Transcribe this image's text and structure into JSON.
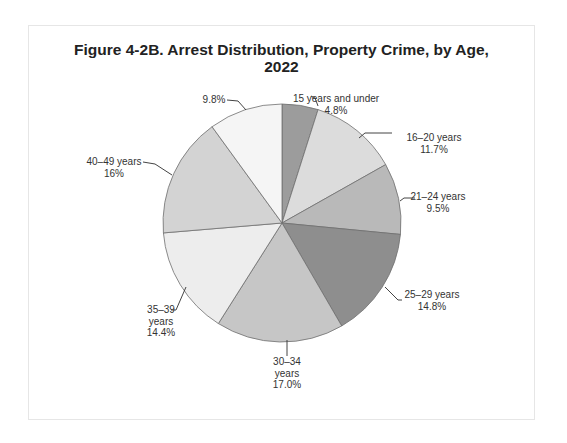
{
  "chart_data": {
    "type": "pie",
    "title": "Figure 4-2B. Arrest Distribution, Property Crime, by Age, 2022",
    "title_lines": [
      "Figure 4-2B. Arrest Distribution, Property Crime, by Age,",
      "2022"
    ],
    "start": "12 o'clock",
    "direction": "clockwise",
    "slices": [
      {
        "name": "15 years and under",
        "value": 4.8,
        "value_label": "4.8%",
        "label_lines": [
          "15 years and under",
          "4.8%"
        ],
        "color": "#9c9c9c"
      },
      {
        "name": "16–20 years",
        "value": 11.7,
        "value_label": "11.7%",
        "label_lines": [
          "16–20 years",
          "11.7%"
        ],
        "color": "#dcdcdc"
      },
      {
        "name": "21–24 years",
        "value": 9.5,
        "value_label": "9.5%",
        "label_lines": [
          "21–24 years",
          "9.5%"
        ],
        "color": "#b9b9b9"
      },
      {
        "name": "25–29 years",
        "value": 14.8,
        "value_label": "14.8%",
        "label_lines": [
          "25–29 years",
          "14.8%"
        ],
        "color": "#8e8e8e"
      },
      {
        "name": "30–34 years",
        "value": 17.0,
        "value_label": "17.0%",
        "label_lines": [
          "30–34",
          "years",
          "17.0%"
        ],
        "color": "#c6c6c6"
      },
      {
        "name": "35–39 years",
        "value": 14.4,
        "value_label": "14.4%",
        "label_lines": [
          "35–39",
          "years",
          "14.4%"
        ],
        "color": "#ededed"
      },
      {
        "name": "40–49 years",
        "value": 16,
        "value_label": "16%",
        "label_lines": [
          "40–49 years",
          "16%"
        ],
        "color": "#d3d3d3"
      },
      {
        "name": "",
        "value": 9.8,
        "value_label": "9.8%",
        "label_lines": [
          "9.8%"
        ],
        "color": "#f5f5f5"
      }
    ],
    "legend": "none"
  }
}
